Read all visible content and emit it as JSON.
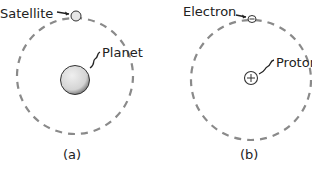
{
  "figure": {
    "panels": [
      {
        "id": "a",
        "caption": "(a)",
        "orbiting_label": "Satellite",
        "central_label": "Planet"
      },
      {
        "id": "b",
        "caption": "(b)",
        "orbiting_label": "Electron",
        "central_label": "Proton",
        "orbiting_symbol": "−",
        "central_symbol": "+"
      }
    ],
    "colors": {
      "orbit": "#8a8a8a",
      "text": "#222222",
      "planet_fill": "#dcdcdc"
    }
  }
}
